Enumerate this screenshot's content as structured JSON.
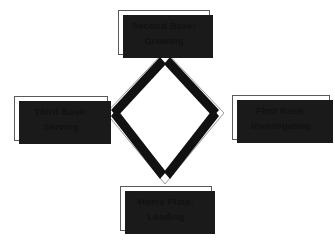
{
  "diagram": {
    "shape": "diamond",
    "colors": {
      "band": "#111111",
      "outline": "#8a8a8a",
      "box_fill": "#ffffff",
      "box_border": "#5a5a5a",
      "shadow": "#1a1a1a",
      "text": "#111111",
      "background": "#ffffff"
    },
    "nodes": [
      {
        "id": "second-base",
        "position": "top",
        "heading": "Second Base:",
        "label": "Growing"
      },
      {
        "id": "first-base",
        "position": "right",
        "heading": "First Base:",
        "label": "Investigating"
      },
      {
        "id": "third-base",
        "position": "left",
        "heading": "Third Base:",
        "label": "Serving"
      },
      {
        "id": "home-plate",
        "position": "bottom",
        "heading": "Home Plate:",
        "label": "Leading"
      }
    ],
    "connectors": [
      {
        "from": "home-plate",
        "to": "first-base",
        "style": "thick-black-band"
      },
      {
        "from": "first-base",
        "to": "second-base",
        "style": "thick-black-band"
      },
      {
        "from": "second-base",
        "to": "third-base",
        "style": "thick-black-band"
      },
      {
        "from": "third-base",
        "to": "home-plate",
        "style": "thick-black-band"
      }
    ]
  }
}
